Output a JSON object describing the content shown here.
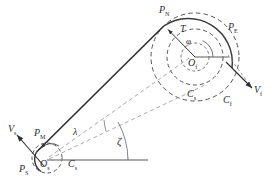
{
  "figure": {
    "type": "line-diagram",
    "background": "#ffffff",
    "colors": {
      "tether": "#2e2e2e",
      "solid_arc": "#3a3a3a",
      "dashed_circle": "#555555",
      "construction_line": "#9a9a9a",
      "reference_line": "#8d8d8d",
      "label": "#2b2b2b"
    }
  },
  "labels": {
    "p_n": {
      "text": "P",
      "sub": "N"
    },
    "p_e": {
      "text": "P",
      "sub": "E"
    },
    "p_m": {
      "text": "P",
      "sub": "M"
    },
    "p_s": {
      "text": "P",
      "sub": "S"
    },
    "o_f": {
      "text": "O",
      "sub": "f"
    },
    "o_s": {
      "text": "O",
      "sub": "s"
    },
    "c_f": {
      "text": "C",
      "sub": "f"
    },
    "c_s_upper": {
      "text": "C",
      "sub": "s"
    },
    "c_s_lower": {
      "text": "C",
      "sub": "s"
    },
    "v_f": {
      "text": "V",
      "sub": "f"
    },
    "v_s": {
      "text": "V",
      "sub": "s"
    },
    "tension": {
      "text": "T",
      "sub": ""
    },
    "phi": {
      "text": "φ"
    },
    "lambda": {
      "text": "λ"
    },
    "zeta": {
      "text": "ζ"
    }
  },
  "geometry": {
    "big_circle": {
      "cx": 195,
      "cy": 57,
      "r": 44,
      "label": "C_f"
    },
    "mid_circle": {
      "cx": 195,
      "cy": 57,
      "r": 28,
      "label": "C_s"
    },
    "inner_circle": {
      "cx": 195,
      "cy": 57,
      "r": 14
    },
    "small_circle": {
      "cx": 47,
      "cy": 158,
      "r": 15,
      "label": "C_s"
    },
    "angle_phi_deg": 118,
    "angle_lambda_deg": 7,
    "angle_zeta_deg": 34,
    "reference_line": {
      "x1": 47,
      "x2": 148,
      "y": 160
    }
  }
}
